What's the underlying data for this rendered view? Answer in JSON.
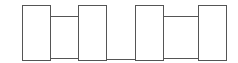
{
  "diagram": {
    "stroke_color": "#555555",
    "fill_color": "#ffffff",
    "tall_boxes": [
      {
        "x": 22,
        "y": 5,
        "w": 29,
        "h": 56
      },
      {
        "x": 78,
        "y": 5,
        "w": 29,
        "h": 56
      },
      {
        "x": 135,
        "y": 5,
        "w": 29,
        "h": 56
      },
      {
        "x": 198,
        "y": 5,
        "w": 29,
        "h": 56
      }
    ],
    "connectors": [
      {
        "x": 50,
        "y": 16,
        "w": 29,
        "h": 43
      },
      {
        "x": 163,
        "y": 16,
        "w": 36,
        "h": 43
      }
    ],
    "lines": [
      {
        "x": 106,
        "y": 59,
        "w": 30
      }
    ]
  }
}
